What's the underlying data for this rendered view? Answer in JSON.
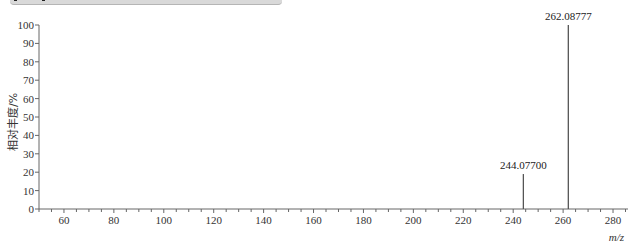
{
  "chart_data": {
    "type": "bar",
    "subtype": "mass-spectrum-stick",
    "title": "",
    "xlabel": "m/z",
    "ylabel": "相对丰度/%",
    "xlim": [
      50,
      286
    ],
    "ylim": [
      0,
      100
    ],
    "x_ticks": [
      60,
      80,
      100,
      120,
      140,
      160,
      180,
      200,
      220,
      240,
      260,
      280
    ],
    "y_ticks": [
      0,
      10,
      20,
      30,
      40,
      50,
      60,
      70,
      80,
      90,
      100
    ],
    "grid": false,
    "legend": null,
    "peaks": [
      {
        "mz": 244.077,
        "intensity": 19,
        "label": "244.07700"
      },
      {
        "mz": 262.08777,
        "intensity": 100,
        "label": "262.08777"
      }
    ],
    "color": "#555555"
  },
  "labels": {
    "xlabel": "m/z",
    "ylabel": "相对丰度/%",
    "peak1": "244.07700",
    "peak2": "262.08777"
  }
}
